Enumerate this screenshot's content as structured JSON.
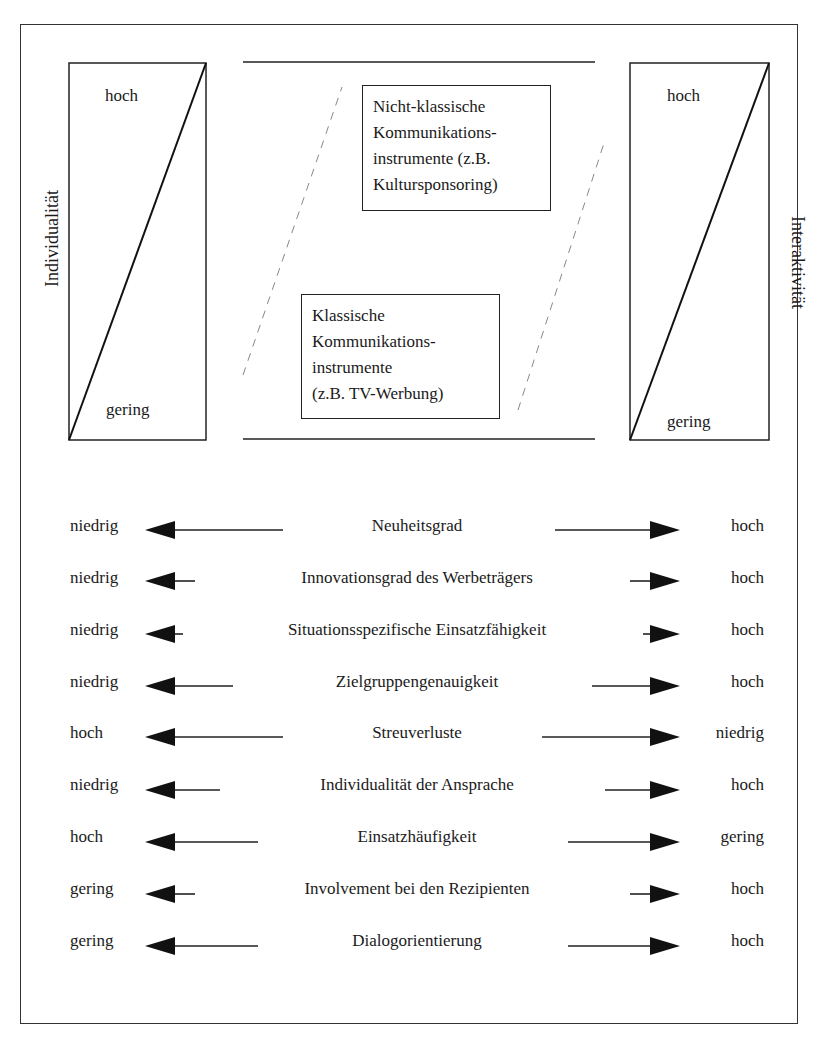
{
  "left_scale": {
    "axis_label": "Individualität",
    "top_label": "hoch",
    "bottom_label": "gering"
  },
  "right_scale": {
    "axis_label": "Interaktivität",
    "top_label": "hoch",
    "bottom_label": "gering"
  },
  "upper_box": {
    "lines": [
      "Nicht-klassische",
      "Kommunikations-",
      "instrumente (z.B.",
      "Kultursponsoring)"
    ]
  },
  "lower_box": {
    "lines": [
      "Klassische",
      "Kommunikations-",
      "instrumente",
      "(z.B. TV-Werbung)"
    ]
  },
  "criteria": [
    {
      "left": "niedrig",
      "label": "Neuheitsgrad",
      "right": "hoch"
    },
    {
      "left": "niedrig",
      "label": "Innovationsgrad des Werbeträgers",
      "right": "hoch"
    },
    {
      "left": "niedrig",
      "label": "Situationsspezifische Einsatzfähigkeit",
      "right": "hoch"
    },
    {
      "left": "niedrig",
      "label": "Zielgruppengenauigkeit",
      "right": "hoch"
    },
    {
      "left": "hoch",
      "label": "Streuverluste",
      "right": "niedrig"
    },
    {
      "left": "niedrig",
      "label": "Individualität der Ansprache",
      "right": "hoch"
    },
    {
      "left": "hoch",
      "label": "Einsatzhäufigkeit",
      "right": "gering"
    },
    {
      "left": "gering",
      "label": "Involvement bei den Rezipienten",
      "right": "hoch"
    },
    {
      "left": "gering",
      "label": "Dialogorientierung",
      "right": "hoch"
    }
  ]
}
